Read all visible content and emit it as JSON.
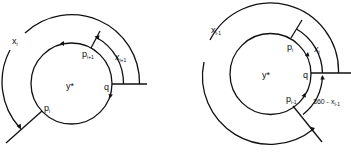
{
  "figure": {
    "left": {
      "center_label": "y*",
      "point_q": "q",
      "point_p_i": {
        "base": "p",
        "sub": "i"
      },
      "point_p_i_plus": {
        "base": "p",
        "sub": "i+1"
      },
      "arc_x_i": {
        "base": "x",
        "sub": "i"
      },
      "arc_x_i_plus": {
        "base": "x",
        "sub": "i+1"
      }
    },
    "right": {
      "center_label": "y*",
      "point_q": "q",
      "point_p_i": {
        "base": "p",
        "sub": "i"
      },
      "point_p_i_minus": {
        "base": "p",
        "sub": "i-1"
      },
      "arc_x_i_minus": {
        "base": "x",
        "sub": "i-1"
      },
      "arc_x_i": {
        "base": "x",
        "sub": "i"
      },
      "arc_360": {
        "base": "360 - x",
        "sub": "i-1"
      }
    }
  }
}
